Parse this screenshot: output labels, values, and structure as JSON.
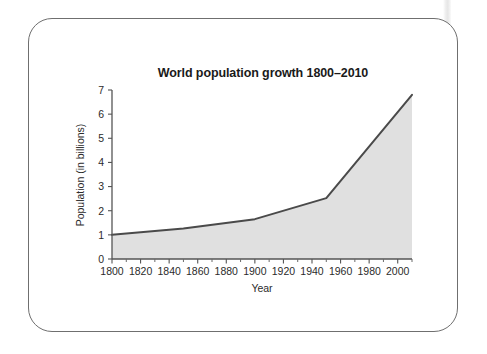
{
  "figure": {
    "background_color": "#ffffff",
    "card": {
      "border_color": "#6f6f6f",
      "background_color": "#ffffff",
      "corner_radius": 24
    }
  },
  "chart_data": {
    "type": "area",
    "title": "World population growth 1800–2010",
    "xlabel": "Year",
    "ylabel": "Population (in billions)",
    "xlim": [
      1800,
      2010
    ],
    "ylim": [
      0,
      7
    ],
    "grid": false,
    "legend": null,
    "series_fill_color": "#e0e0e0",
    "series_line_color": "#4a4a4a",
    "x_major_ticks": [
      1800,
      1820,
      1840,
      1860,
      1880,
      1900,
      1920,
      1940,
      1960,
      1980,
      2000
    ],
    "x_major_tick_labels": [
      "1800",
      "1820",
      "1840",
      "1860",
      "1880",
      "1900",
      "1920",
      "1940",
      "1960",
      "1980",
      "2000"
    ],
    "x_minor_ticks": [
      1810,
      1830,
      1850,
      1870,
      1890,
      1910,
      1930,
      1950,
      1970,
      1990,
      2010
    ],
    "y_ticks": [
      0,
      1,
      2,
      3,
      4,
      5,
      6,
      7
    ],
    "y_tick_labels": [
      "0",
      "1",
      "2",
      "3",
      "4",
      "5",
      "6",
      "7"
    ],
    "x": [
      1800,
      1850,
      1900,
      1950,
      2010
    ],
    "values": [
      1.0,
      1.26,
      1.65,
      2.52,
      6.8
    ],
    "series": [
      {
        "name": "World population",
        "x": [
          1800,
          1850,
          1900,
          1950,
          2010
        ],
        "values": [
          1.0,
          1.26,
          1.65,
          2.52,
          6.8
        ]
      }
    ]
  }
}
